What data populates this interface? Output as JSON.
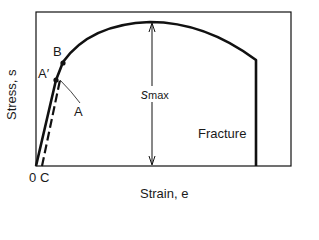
{
  "diagram": {
    "type": "stress-strain curve",
    "axes": {
      "ylabel": "Stress, s",
      "xlabel": "Strain, e",
      "origin_label": "0",
      "offset_label": "C"
    },
    "points": {
      "a_prime": "A′",
      "b": "B",
      "a": "A"
    },
    "annotations": {
      "smax_main": "s",
      "smax_sub": "max",
      "fracture": "Fracture"
    },
    "colors": {
      "line": "#111111",
      "background": "#ffffff"
    }
  }
}
